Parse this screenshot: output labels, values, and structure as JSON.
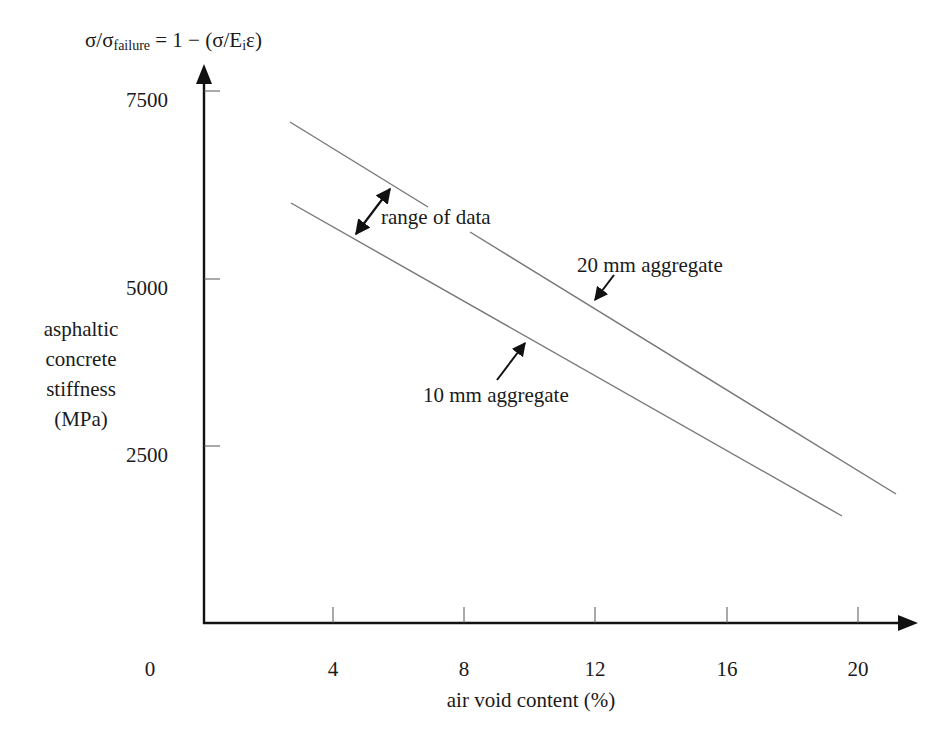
{
  "title": {
    "prefix": "σ/σ",
    "subscript": "failure",
    "suffix_a": " = 1 − (σ/E",
    "subscript_i": "i",
    "suffix_b": "ε)"
  },
  "y_axis": {
    "label_lines": [
      "asphaltic",
      "concrete",
      "stiffness",
      "(MPa)"
    ],
    "ticks": [
      {
        "label": "7500",
        "value": 7500,
        "py": 91
      },
      {
        "label": "5000",
        "value": 5000,
        "py": 279
      },
      {
        "label": "2500",
        "value": 2500,
        "py": 446
      }
    ]
  },
  "x_axis": {
    "label": "air void content (%)",
    "ticks": [
      {
        "label": "0",
        "value": 0,
        "px": 150,
        "tick": false
      },
      {
        "label": "4",
        "value": 4,
        "px": 333,
        "tick": true
      },
      {
        "label": "8",
        "value": 8,
        "px": 464,
        "tick": true
      },
      {
        "label": "12",
        "value": 12,
        "px": 595,
        "tick": true
      },
      {
        "label": "16",
        "value": 16,
        "px": 727,
        "tick": true
      },
      {
        "label": "20",
        "value": 20,
        "px": 858,
        "tick": true
      }
    ]
  },
  "annotations": {
    "range": "range of data",
    "agg20": "20 mm aggregate",
    "agg10": "10 mm aggregate"
  },
  "colors": {
    "axis": "#111111",
    "series_line": "#777777",
    "text": "#1a1a1a"
  },
  "chart_data": {
    "type": "line",
    "title": "σ/σfailure = 1 − (σ/Eiε)",
    "xlabel": "air void content (%)",
    "ylabel": "asphaltic concrete stiffness (MPa)",
    "xlim": [
      0,
      22
    ],
    "ylim": [
      0,
      8000
    ],
    "x_ticks": [
      0,
      4,
      8,
      12,
      16,
      20
    ],
    "y_ticks": [
      2500,
      5000,
      7500
    ],
    "grid": false,
    "legend": "none (inline annotations)",
    "series": [
      {
        "name": "20 mm aggregate",
        "x": [
          3,
          21
        ],
        "values": [
          7100,
          1800
        ]
      },
      {
        "name": "10 mm aggregate",
        "x": [
          3,
          19.5
        ],
        "values": [
          6000,
          1500
        ]
      }
    ],
    "annotations": [
      {
        "text": "range of data",
        "type": "double-arrow between lines",
        "x": 5
      }
    ]
  }
}
